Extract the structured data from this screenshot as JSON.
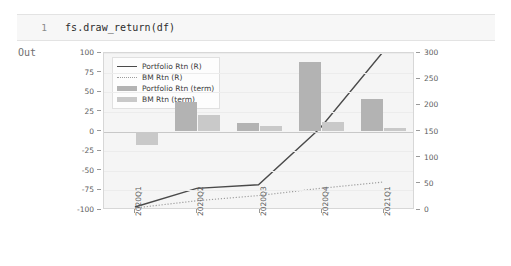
{
  "notebook": {
    "line_number": "1",
    "source": "fs.draw_return(df)",
    "output_label": "Out"
  },
  "chart_data": {
    "type": "bar",
    "title": "",
    "xlabel": "",
    "ylabel": "",
    "grid": true,
    "legend_position": "upper left",
    "categories": [
      "2020Q1",
      "2020Q2",
      "2020Q3",
      "2020Q4",
      "2021Q1"
    ],
    "left_axis": {
      "label": "",
      "ylim": [
        -100,
        100
      ],
      "ticks": [
        "100",
        "75",
        "50",
        "25",
        "0",
        "-25",
        "-50",
        "-75",
        "-100"
      ],
      "tick_values": [
        100,
        75,
        50,
        25,
        0,
        -25,
        -50,
        -75,
        -100
      ]
    },
    "right_axis": {
      "label": "",
      "ylim": [
        0,
        300
      ],
      "ticks": [
        "300",
        "250",
        "200",
        "150",
        "100",
        "50",
        "0"
      ],
      "tick_values": [
        300,
        250,
        200,
        150,
        100,
        50,
        0
      ]
    },
    "series": [
      {
        "name": "Portfolio Rtn (term)",
        "kind": "bar",
        "axis": "left",
        "color": "#b3b3b3",
        "values": [
          0,
          37,
          11,
          89,
          42
        ]
      },
      {
        "name": "BM Rtn (term)",
        "kind": "bar",
        "axis": "left",
        "color": "#c9c9c9",
        "values": [
          -17,
          21,
          7,
          12,
          5
        ]
      },
      {
        "name": "Portfolio Rtn (R)",
        "kind": "line",
        "style": "solid",
        "axis": "right",
        "color": "#4a4a4a",
        "values": [
          2,
          38,
          45,
          155,
          300
        ]
      },
      {
        "name": "BM Rtn (R)",
        "kind": "line",
        "style": "dotted",
        "axis": "right",
        "color": "#9c9c9c",
        "values": [
          0,
          14,
          24,
          38,
          50
        ]
      }
    ],
    "legend_entries": [
      "Portfolio Rtn (R)",
      "BM Rtn (R)",
      "Portfolio Rtn (term)",
      "BM Rtn (term)"
    ]
  }
}
